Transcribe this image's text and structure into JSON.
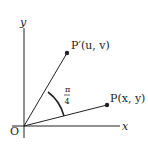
{
  "diagram": {
    "title": "",
    "axes": {
      "x_label": "x",
      "y_label": "y",
      "origin_label": "O"
    },
    "points": [
      {
        "id": "P",
        "label": "P(x, y)"
      },
      {
        "id": "P_prime",
        "label": "P′(u, v)"
      }
    ],
    "angle": {
      "numerator": "π",
      "denominator": "4",
      "value_text": "π/4"
    },
    "colors": {
      "line": "#222222",
      "background": "#ffffff"
    }
  }
}
